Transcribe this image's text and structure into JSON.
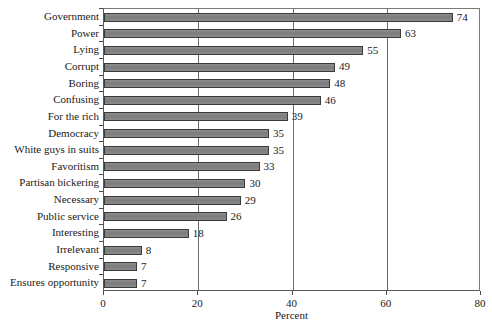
{
  "chart_data": {
    "type": "bar",
    "orientation": "horizontal",
    "title": "",
    "subtitle": "",
    "xlabel": "Percent",
    "ylabel": "",
    "xlim": [
      0,
      80
    ],
    "xticks": [
      0,
      20,
      40,
      60,
      80
    ],
    "xtick_labels": [
      "0",
      "20",
      "40",
      "60",
      "80"
    ],
    "grid": "vertical gridlines at 20, 40, 60",
    "legend": "none",
    "data_labels": true,
    "categories": [
      "Government",
      "Power",
      "Lying",
      "Corrupt",
      "Boring",
      "Confusing",
      "For the rich",
      "Democracy",
      "White guys in suits",
      "Favoritism",
      "Partisan bickering",
      "Necessary",
      "Public service",
      "Interesting",
      "Irrelevant",
      "Responsive",
      "Ensures opportunity"
    ],
    "values": [
      74,
      63,
      55,
      49,
      48,
      46,
      39,
      35,
      35,
      33,
      30,
      29,
      26,
      18,
      8,
      7,
      7
    ],
    "value_labels": [
      "74",
      "63",
      "55",
      "49",
      "48",
      "46",
      "39",
      "35",
      "35",
      "33",
      "30",
      "29",
      "26",
      "18",
      "8",
      "7",
      "7"
    ],
    "colors": {
      "bar_fill": "#808080",
      "bar_border": "#3a3a3a",
      "gridline": "#6e6e6e",
      "axis": "#4a4a4a",
      "text": "#1a1a1a",
      "background": "#ffffff"
    }
  }
}
